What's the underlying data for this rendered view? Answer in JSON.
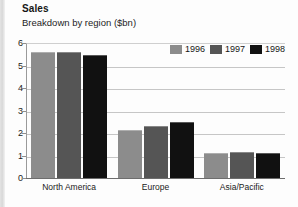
{
  "chart_data": {
    "type": "bar",
    "title": "Sales",
    "subtitle": "Breakdown by region ($bn)",
    "xlabel": "",
    "ylabel": "",
    "ylim": [
      0,
      6
    ],
    "yticks": [
      0,
      1,
      2,
      3,
      4,
      5,
      6
    ],
    "ytick_labels": [
      "0",
      "1",
      "2",
      "3",
      "4",
      "5",
      "6"
    ],
    "grid": true,
    "legend_position": "top-right",
    "categories": [
      "North America",
      "Europe",
      "Asia/Pacific"
    ],
    "series": [
      {
        "name": "1996",
        "color": "#8c8c8c",
        "values": [
          5.6,
          2.15,
          1.1
        ]
      },
      {
        "name": "1997",
        "color": "#555555",
        "values": [
          5.6,
          2.3,
          1.15
        ]
      },
      {
        "name": "1998",
        "color": "#111111",
        "values": [
          5.45,
          2.5,
          1.1
        ]
      }
    ]
  }
}
